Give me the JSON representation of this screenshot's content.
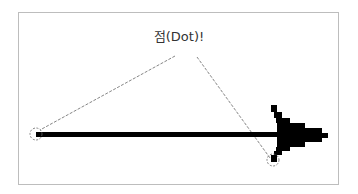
{
  "diagram": {
    "label": "점(Dot)!",
    "colors": {
      "frame": "#bdbdbd",
      "arrow": "#000000",
      "leader": "#555555",
      "circle": "#555555"
    }
  }
}
